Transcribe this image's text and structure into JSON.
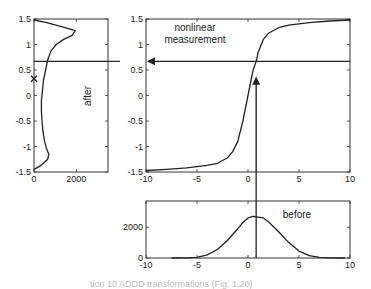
{
  "chart_data": [
    {
      "id": "after",
      "type": "line",
      "orientation": "horizontal-histogram",
      "label": "after",
      "xlim": [
        0,
        3500
      ],
      "ylim": [
        -1.5,
        1.5
      ],
      "xticks": [
        0,
        2000
      ],
      "xtick_labels": [
        "0",
        "2000"
      ],
      "yticks": [
        -1.5,
        -1,
        -0.5,
        0,
        0.5,
        1,
        1.5
      ],
      "ytick_labels": [
        "-1.5",
        "-1",
        "-0.5",
        "0",
        "0.5",
        "1",
        "1.5"
      ],
      "grid": false,
      "series": [
        {
          "name": "after histogram",
          "points": [
            [
              0,
              1.48
            ],
            [
              600,
              1.43
            ],
            [
              1300,
              1.35
            ],
            [
              1950,
              1.27
            ],
            [
              1800,
              1.18
            ],
            [
              1400,
              1.1
            ],
            [
              1050,
              1.0
            ],
            [
              800,
              0.87
            ],
            [
              650,
              0.7
            ],
            [
              550,
              0.5
            ],
            [
              450,
              0.3
            ],
            [
              400,
              0.1
            ],
            [
              350,
              -0.1
            ],
            [
              350,
              -0.3
            ],
            [
              380,
              -0.5
            ],
            [
              420,
              -0.7
            ],
            [
              500,
              -0.9
            ],
            [
              600,
              -1.05
            ],
            [
              700,
              -1.15
            ],
            [
              650,
              -1.25
            ],
            [
              300,
              -1.38
            ],
            [
              0,
              -1.45
            ]
          ]
        }
      ],
      "hline": 0.67,
      "marker": {
        "symbol": "x",
        "x": 0,
        "y": 0.33
      }
    },
    {
      "id": "nonlinear",
      "type": "line",
      "label": "nonlinear measurement",
      "xlim": [
        -10,
        10
      ],
      "ylim": [
        -1.5,
        1.5
      ],
      "xticks": [
        -10,
        -5,
        0,
        5,
        10
      ],
      "xtick_labels": [
        "-10",
        "-5",
        "0",
        "5",
        "10"
      ],
      "yticks": [
        -1.5,
        -1,
        -0.5,
        0,
        0.5,
        1,
        1.5
      ],
      "ytick_labels": [
        "-1.5",
        "-1",
        "-0.5",
        "0",
        "0.5",
        "1",
        "1.5"
      ],
      "grid": false,
      "series": [
        {
          "name": "measurement function",
          "points": [
            [
              -10,
              -1.47
            ],
            [
              -8,
              -1.45
            ],
            [
              -6,
              -1.42
            ],
            [
              -4,
              -1.37
            ],
            [
              -3,
              -1.33
            ],
            [
              -2,
              -1.22
            ],
            [
              -1.5,
              -1.1
            ],
            [
              -1,
              -0.9
            ],
            [
              -0.5,
              -0.5
            ],
            [
              0,
              0
            ],
            [
              0.5,
              0.5
            ],
            [
              0.8,
              0.67
            ],
            [
              1,
              0.85
            ],
            [
              1.5,
              1.1
            ],
            [
              2,
              1.22
            ],
            [
              3,
              1.33
            ],
            [
              4,
              1.38
            ],
            [
              6,
              1.43
            ],
            [
              8,
              1.46
            ],
            [
              10,
              1.48
            ]
          ]
        }
      ],
      "arrows": [
        {
          "name": "input-arrow",
          "from": [
            0.8,
            -1.5
          ],
          "to": [
            0.8,
            0.35
          ]
        },
        {
          "name": "output-arrow",
          "from": [
            10,
            0.67
          ],
          "to": [
            -10,
            0.67
          ]
        }
      ],
      "annotation": {
        "text_line1": "nonlinear",
        "text_line2": "measurement",
        "x": -5.2,
        "y": 1.15
      }
    },
    {
      "id": "before",
      "type": "line",
      "label": "before",
      "xlim": [
        -10,
        10
      ],
      "ylim": [
        0,
        3700
      ],
      "xticks": [
        -10,
        -5,
        0,
        5,
        10
      ],
      "xtick_labels": [
        "-10",
        "-5",
        "0",
        "5",
        "10"
      ],
      "yticks": [
        0,
        2000
      ],
      "ytick_labels": [
        "0",
        "2000"
      ],
      "grid": false,
      "series": [
        {
          "name": "before histogram",
          "points": [
            [
              -7.5,
              0
            ],
            [
              -6,
              10
            ],
            [
              -5,
              40
            ],
            [
              -4,
              200
            ],
            [
              -3,
              550
            ],
            [
              -2,
              1150
            ],
            [
              -1,
              1900
            ],
            [
              -0.5,
              2300
            ],
            [
              0,
              2600
            ],
            [
              0.5,
              2700
            ],
            [
              1,
              2650
            ],
            [
              1.5,
              2600
            ],
            [
              2,
              2350
            ],
            [
              3,
              1700
            ],
            [
              4,
              1000
            ],
            [
              5,
              450
            ],
            [
              6,
              150
            ],
            [
              7,
              40
            ],
            [
              8,
              10
            ],
            [
              9.5,
              0
            ]
          ]
        }
      ],
      "vline": 0.8
    }
  ],
  "caption": "tion 10 ADDD transformations (Fig. 1.20)",
  "colors": {
    "line": "#222222",
    "axes": "#333333",
    "caption": "#bbbbbb"
  }
}
